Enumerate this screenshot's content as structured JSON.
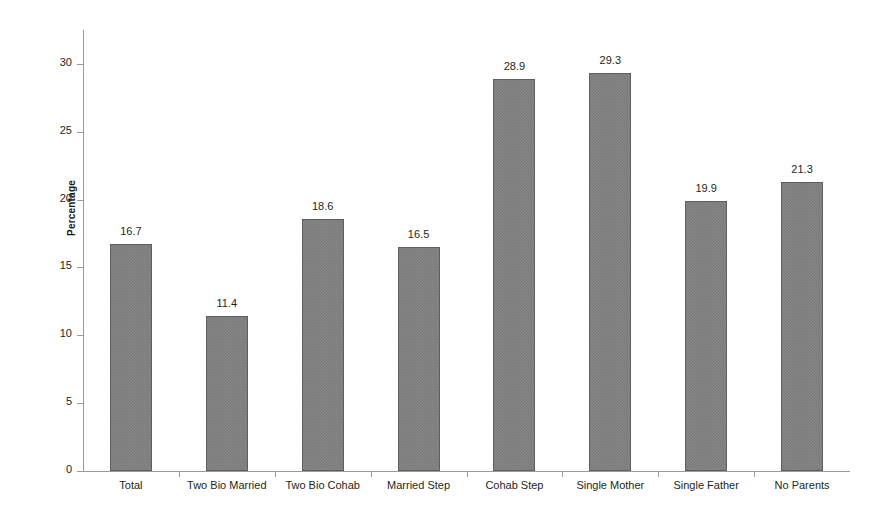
{
  "chart_data": {
    "type": "bar",
    "title": "",
    "subtitle": "",
    "xlabel": "",
    "ylabel": "Percentage",
    "ylim": [
      0,
      32.5
    ],
    "yticks": [
      0,
      5,
      10,
      15,
      20,
      25,
      30
    ],
    "ytick_labels": [
      "0",
      "5",
      "10",
      "15",
      "20",
      "25",
      "30"
    ],
    "grid": false,
    "legend": false,
    "legend_position": "none",
    "bar_color": "#7b7b7b",
    "bar_edge_color": "#5e5e5e",
    "axis_color": "#9a9a9a",
    "text_color": "#231f20",
    "background": "#ffffff",
    "categories": [
      "Total",
      "Two Bio Married",
      "Two Bio Cohab",
      "Married Step",
      "Cohab Step",
      "Single Mother",
      "Single Father",
      "No Parents"
    ],
    "values": [
      16.7,
      11.4,
      18.6,
      16.5,
      28.9,
      29.3,
      19.9,
      21.3
    ],
    "value_labels": [
      "16.7",
      "11.4",
      "18.6",
      "16.5",
      "28.9",
      "29.3",
      "19.9",
      "21.3"
    ]
  }
}
